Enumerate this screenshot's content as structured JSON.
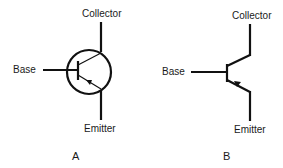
{
  "diagrams": [
    {
      "id": "A",
      "caption": "A",
      "style": "transistor symbol with circle envelope",
      "labels": {
        "collector": "Collector",
        "base": "Base",
        "emitter": "Emitter"
      }
    },
    {
      "id": "B",
      "caption": "B",
      "style": "transistor symbol without circle",
      "labels": {
        "collector": "Collector",
        "base": "Base",
        "emitter": "Emitter"
      }
    }
  ],
  "colors": {
    "stroke": "#111111",
    "background": "#ffffff"
  }
}
